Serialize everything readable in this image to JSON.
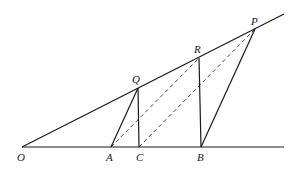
{
  "diagram": {
    "type": "geometry",
    "points": {
      "O": {
        "label": "O",
        "x": 22,
        "y": 147,
        "lx": 17,
        "ly": 161
      },
      "A": {
        "label": "A",
        "x": 111,
        "y": 147,
        "lx": 106,
        "ly": 161
      },
      "C": {
        "label": "C",
        "x": 139,
        "y": 147,
        "lx": 136,
        "ly": 161
      },
      "B": {
        "label": "B",
        "x": 201,
        "y": 147,
        "lx": 197,
        "ly": 161
      },
      "Q": {
        "label": "Q",
        "x": 138,
        "y": 88,
        "lx": 132,
        "ly": 83
      },
      "R": {
        "label": "R",
        "x": 199,
        "y": 58,
        "lx": 194,
        "ly": 53
      },
      "P": {
        "label": "P",
        "x": 255,
        "y": 29,
        "lx": 251,
        "ly": 25
      }
    },
    "solid_segments": [
      [
        "O",
        "P_ext"
      ],
      [
        "O",
        "B_ext"
      ],
      [
        "A",
        "Q"
      ],
      [
        "Q",
        "C"
      ],
      [
        "R",
        "B"
      ],
      [
        "B",
        "P"
      ]
    ],
    "dashed_segments": [
      [
        "A",
        "R"
      ],
      [
        "C",
        "P"
      ]
    ],
    "extensions": {
      "P_ext": {
        "x": 284,
        "y": 14
      },
      "B_ext": {
        "x": 284,
        "y": 147
      }
    }
  }
}
